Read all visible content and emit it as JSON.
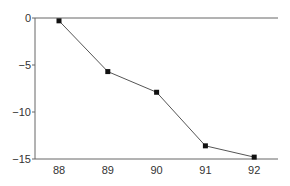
{
  "chart_data": {
    "type": "line",
    "title": "",
    "xlabel": "",
    "ylabel": "",
    "categories": [
      "88",
      "89",
      "90",
      "91",
      "92"
    ],
    "x": [
      88,
      89,
      90,
      91,
      92
    ],
    "series": [
      {
        "name": "series",
        "values": [
          -0.3,
          -5.7,
          -7.9,
          -13.6,
          -14.8
        ]
      }
    ],
    "ylim": [
      -15,
      0
    ],
    "yticks": [
      0,
      -5,
      -10,
      -15
    ],
    "ytick_labels": [
      "0",
      "−5",
      "−10",
      "−15"
    ],
    "xtick_labels": [
      "88",
      "89",
      "90",
      "91",
      "92"
    ],
    "grid": false,
    "legend": null,
    "marker": "square",
    "colors": {
      "line": "#555555",
      "marker": "#111111",
      "axis": "#666666"
    }
  }
}
